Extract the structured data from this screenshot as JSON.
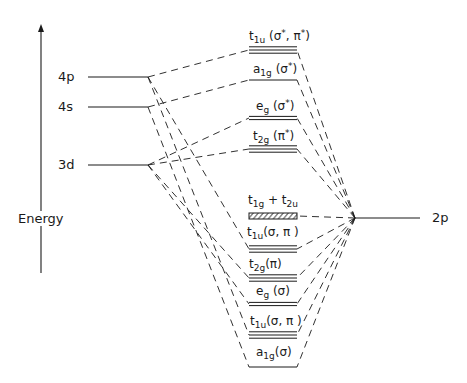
{
  "axis": {
    "label": "Energy",
    "arrow_x": 41,
    "arrow_top": 24,
    "arrow_bottom": 273
  },
  "metal_orbitals": [
    {
      "id": "4p",
      "label": "4p",
      "y": 77,
      "x1": 88,
      "x2": 148,
      "label_x": 58
    },
    {
      "id": "4s",
      "label": "4s",
      "y": 107,
      "x1": 88,
      "x2": 148,
      "label_x": 58
    },
    {
      "id": "3d",
      "label": "3d",
      "y": 165,
      "x1": 88,
      "x2": 148,
      "label_x": 58
    }
  ],
  "ligand_orbital": {
    "id": "2p",
    "label": "2p",
    "y": 218,
    "x1": 355,
    "x2": 420,
    "label_x": 432
  },
  "molecular_orbitals": [
    {
      "id": "t1u_star",
      "name": "t",
      "sub": "1u",
      "rest": " (σ",
      "sup1": "*",
      "rest2": ", π",
      "sup2": "*",
      "rest3": ")",
      "y": 50,
      "lines": 3,
      "label_x": 249,
      "label_y": 29
    },
    {
      "id": "a1g_star",
      "name": "a",
      "sub": "1g",
      "rest": " (σ",
      "sup1": "*",
      "rest2": ")",
      "sup2": "",
      "rest3": "",
      "y": 80,
      "lines": 1,
      "label_x": 253,
      "label_y": 62
    },
    {
      "id": "eg_star",
      "name": "e",
      "sub": "g",
      "rest": " (σ",
      "sup1": "*",
      "rest2": ")",
      "sup2": "",
      "rest3": "",
      "y": 118,
      "lines": 2,
      "label_x": 256,
      "label_y": 99
    },
    {
      "id": "t2g_star",
      "name": "t",
      "sub": "2g",
      "rest": " (π",
      "sup1": "*",
      "rest2": ")",
      "sup2": "",
      "rest3": "",
      "y": 149,
      "lines": 3,
      "label_x": 253,
      "label_y": 129
    },
    {
      "id": "t1g_t2u",
      "name": "t",
      "sub": "1g",
      "rest": " + t",
      "sup1": "",
      "rest2": "",
      "sup2": "",
      "rest3": "",
      "sub2": "2u",
      "y": 216,
      "lines": 0,
      "hatched": true,
      "label_x": 248,
      "label_y": 194
    },
    {
      "id": "t1u_b1",
      "name": "t",
      "sub": "1u",
      "rest": "(σ, π )",
      "sup1": "",
      "rest2": "",
      "sup2": "",
      "rest3": "",
      "y": 249,
      "lines": 3,
      "label_x": 247,
      "label_y": 226
    },
    {
      "id": "t2g_b",
      "name": "t",
      "sub": "2g",
      "rest": "(π)",
      "sup1": "",
      "rest2": "",
      "sup2": "",
      "rest3": "",
      "y": 278,
      "lines": 3,
      "label_x": 249,
      "label_y": 258
    },
    {
      "id": "eg_b",
      "name": "e",
      "sub": "g",
      "rest": " (σ)",
      "sup1": "",
      "rest2": "",
      "sup2": "",
      "rest3": "",
      "y": 304,
      "lines": 2,
      "label_x": 256,
      "label_y": 285
    },
    {
      "id": "t1u_b2",
      "name": "t",
      "sub": "1u",
      "rest": "(σ, π )",
      "sup1": "",
      "rest2": "",
      "sup2": "",
      "rest3": "",
      "y": 335,
      "lines": 3,
      "label_x": 250,
      "label_y": 315
    },
    {
      "id": "a1g_b",
      "name": "a",
      "sub": "1g",
      "rest": "(σ)",
      "sup1": "",
      "rest2": "",
      "sup2": "",
      "rest3": "",
      "y": 367,
      "lines": 1,
      "label_x": 256,
      "label_y": 346
    }
  ],
  "mo_x1": 249,
  "mo_x2": 297,
  "ligand_vertex": {
    "x": 355,
    "y": 218
  },
  "connections": {
    "metal_to_mo": [
      {
        "from": "4p",
        "to": "t1u_star"
      },
      {
        "from": "4s",
        "to": "a1g_star"
      },
      {
        "from": "3d",
        "to": "eg_star"
      },
      {
        "from": "3d",
        "to": "t2g_star"
      },
      {
        "from": "4p",
        "to": "t1u_b1"
      },
      {
        "from": "3d",
        "to": "t2g_b"
      },
      {
        "from": "3d",
        "to": "eg_b"
      },
      {
        "from": "4p",
        "to": "t1u_b2"
      },
      {
        "from": "4s",
        "to": "a1g_b"
      }
    ],
    "ligand_to_mo": [
      "t1u_star",
      "a1g_star",
      "eg_star",
      "t2g_star",
      "t1g_t2u",
      "t1u_b1",
      "t2g_b",
      "eg_b",
      "t1u_b2",
      "a1g_b"
    ]
  },
  "colors": {
    "ink": "#1a1a1a",
    "background": "#ffffff"
  }
}
